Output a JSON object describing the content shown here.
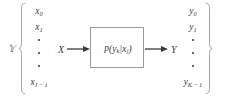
{
  "figure": {
    "type": "channel-diagram",
    "colors": {
      "text": "#3b3b3b",
      "box_border": "#9a9a9a",
      "brace": "#8c8c8c",
      "arrow": "#3a3a3a",
      "background": "#ffffff"
    }
  },
  "input_set": {
    "label": "X",
    "label_name": "script-x",
    "brace": "{",
    "items": [
      {
        "base": "x",
        "sub": "0"
      },
      {
        "base": "x",
        "sub": "1"
      },
      {
        "base": "",
        "sub": ""
      },
      {
        "base": "",
        "sub": ""
      },
      {
        "base": "",
        "sub": ""
      },
      {
        "base": "x",
        "sub": "J − 1"
      }
    ],
    "ellipsis_count": 3
  },
  "output_set": {
    "label": "Y",
    "label_name": "script-y",
    "brace": "}",
    "items": [
      {
        "base": "y",
        "sub": "0"
      },
      {
        "base": "y",
        "sub": "1"
      },
      {
        "base": "",
        "sub": ""
      },
      {
        "base": "",
        "sub": ""
      },
      {
        "base": "",
        "sub": ""
      },
      {
        "base": "y",
        "sub": "K − 1"
      }
    ],
    "ellipsis_count": 3
  },
  "channel": {
    "expression": "p(y_k|x_j)",
    "p": "p",
    "open_paren": "(",
    "out_var": "y",
    "out_sub": "k",
    "conditional_bar": "|",
    "in_var": "x",
    "in_sub": "j",
    "close_paren": ")"
  },
  "arrows": {
    "input": {
      "label": "X",
      "direction": "right"
    },
    "output": {
      "label": "Y",
      "direction": "right"
    }
  },
  "vector_labels": {
    "x0": "x0",
    "x1": "x1",
    "xJ1": "xJ-1",
    "y0": "y0",
    "y1": "y1",
    "yK1": "yK-1"
  }
}
